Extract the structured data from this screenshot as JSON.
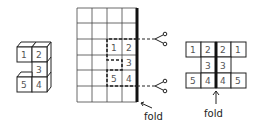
{
  "figure": {
    "cube_model": {
      "faces": [
        "1",
        "2",
        "3",
        "5",
        "4"
      ]
    },
    "grid_net": {
      "columns": 4,
      "rows": 6,
      "cells": [
        {
          "label": "1",
          "col": 2,
          "row": 2
        },
        {
          "label": "2",
          "col": 3,
          "row": 2
        },
        {
          "label": "3",
          "col": 3,
          "row": 3
        },
        {
          "label": "5",
          "col": 2,
          "row": 4
        },
        {
          "label": "4",
          "col": 3,
          "row": 4
        }
      ],
      "cut_icons": [
        "scissors-icon",
        "scissors-icon"
      ],
      "fold_label": "fold"
    },
    "unfolded_net": {
      "rows": [
        [
          "1",
          "2",
          "2",
          "1"
        ],
        [
          "",
          "3",
          "3",
          ""
        ],
        [
          "5",
          "4",
          "4",
          "5"
        ]
      ],
      "fold_label": "fold"
    },
    "colors": {
      "line": "#222222",
      "text": "#555555",
      "grid": "#444444"
    }
  }
}
